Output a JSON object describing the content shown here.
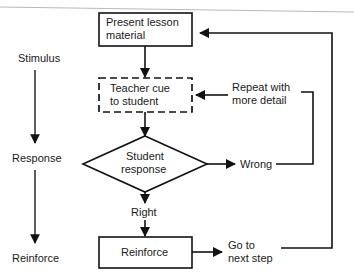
{
  "diagram": {
    "colors": {
      "ink": "#121212",
      "paper": "#ffffff",
      "scan_artifact": "#b9b9b9"
    },
    "lane_labels": [
      {
        "id": "stimulus",
        "label": "Stimulus"
      },
      {
        "id": "response",
        "label": "Response"
      },
      {
        "id": "reinforce",
        "label": "Reinforce"
      }
    ],
    "nodes": [
      {
        "id": "present-lesson",
        "shape": "rectangle",
        "border": "solid",
        "lines": [
          "Present lesson",
          "material"
        ]
      },
      {
        "id": "teacher-cue",
        "shape": "rectangle",
        "border": "dashed",
        "lines": [
          "Teacher cue",
          "to student"
        ]
      },
      {
        "id": "student-response",
        "shape": "diamond",
        "border": "solid",
        "lines": [
          "Student",
          "response"
        ]
      },
      {
        "id": "reinforce-box",
        "shape": "rectangle",
        "border": "solid",
        "lines": [
          "Reinforce"
        ]
      }
    ],
    "edge_labels": [
      {
        "id": "repeat-with-more-detail",
        "lines": [
          "Repeat with",
          "more detail"
        ]
      },
      {
        "id": "wrong",
        "lines": [
          "Wrong"
        ]
      },
      {
        "id": "right",
        "lines": [
          "Right"
        ]
      },
      {
        "id": "go-to-next-step",
        "lines": [
          "Go to",
          "next step"
        ]
      }
    ]
  }
}
